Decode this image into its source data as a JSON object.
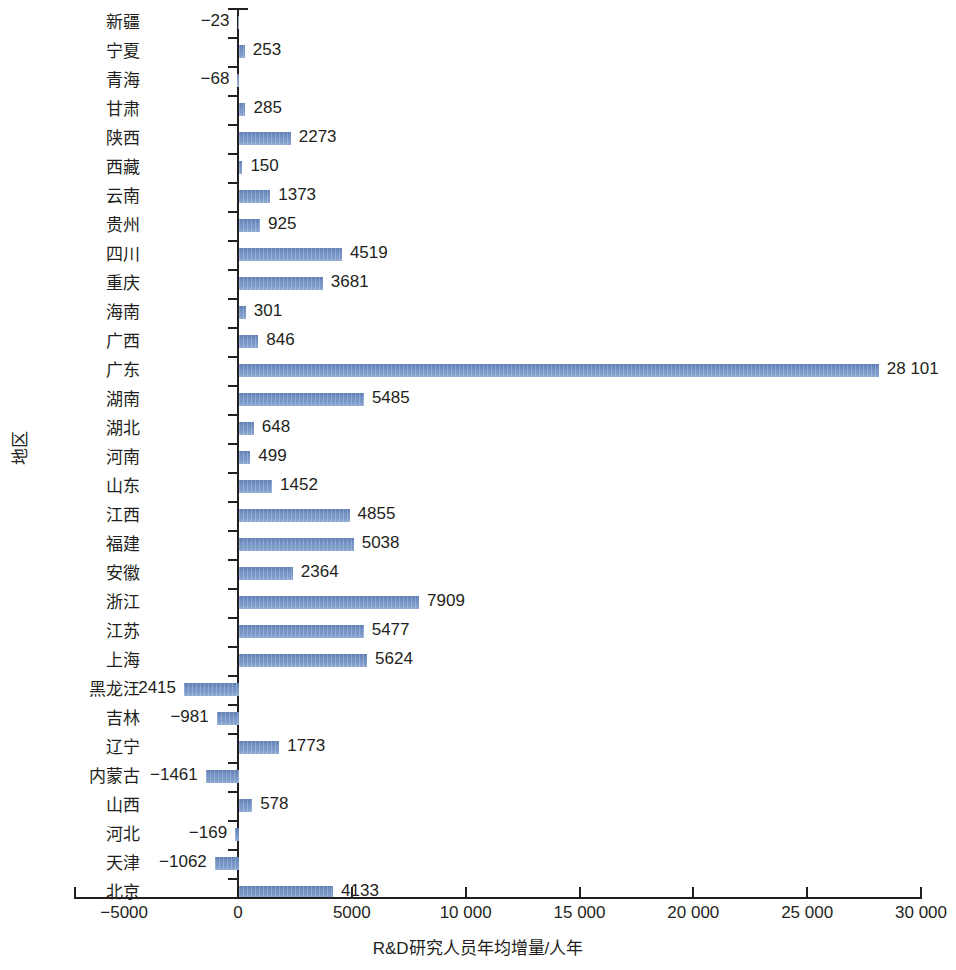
{
  "chart_data": {
    "type": "bar",
    "orientation": "horizontal",
    "title": "",
    "xlabel": "R&D研究人员年均增量/人年",
    "ylabel": "地区",
    "xlim": [
      -5000,
      30000
    ],
    "xticks": [
      -5000,
      0,
      5000,
      10000,
      15000,
      20000,
      25000,
      30000
    ],
    "xtick_labels": [
      "−5000",
      "0",
      "5000",
      "10 000",
      "15 000",
      "20 000",
      "25 000",
      "30 000"
    ],
    "grid": false,
    "legend": null,
    "bar_color": "#7493c4",
    "axis_color": "#231f20",
    "categories": [
      "新疆",
      "宁夏",
      "青海",
      "甘肃",
      "陕西",
      "西藏",
      "云南",
      "贵州",
      "四川",
      "重庆",
      "海南",
      "广西",
      "广东",
      "湖南",
      "湖北",
      "河南",
      "山东",
      "江西",
      "福建",
      "安徽",
      "浙江",
      "江苏",
      "上海",
      "黑龙江",
      "吉林",
      "辽宁",
      "内蒙古",
      "山西",
      "河北",
      "天津",
      "北京"
    ],
    "values": [
      -23,
      253,
      -68,
      285,
      2273,
      150,
      1373,
      925,
      4519,
      3681,
      301,
      846,
      28101,
      5485,
      648,
      499,
      1452,
      4855,
      5038,
      2364,
      7909,
      5477,
      5624,
      -2415,
      -981,
      1773,
      -1461,
      578,
      -169,
      -1062,
      4133
    ],
    "value_labels": [
      "−23",
      "253",
      "−68",
      "285",
      "2273",
      "150",
      "1373",
      "925",
      "4519",
      "3681",
      "301",
      "846",
      "28 101",
      "5485",
      "648",
      "499",
      "1452",
      "4855",
      "5038",
      "2364",
      "7909",
      "5477",
      "5624",
      "−2415",
      "−981",
      "1773",
      "−1461",
      "578",
      "−169",
      "−1062",
      "4133"
    ]
  }
}
